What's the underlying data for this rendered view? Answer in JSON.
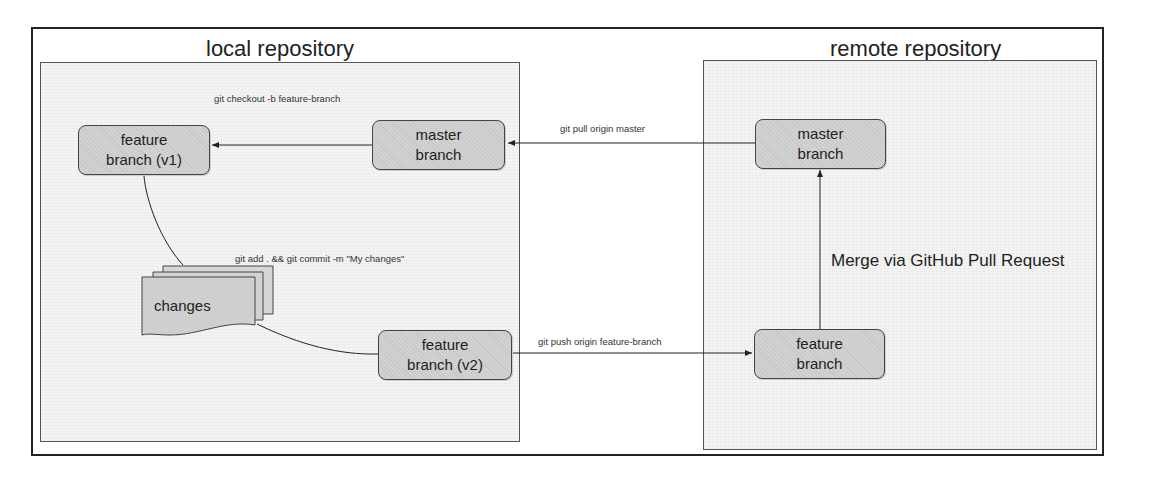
{
  "local": {
    "title": "local repository",
    "nodes": {
      "feature_v1": {
        "line1": "feature",
        "line2": "branch (v1)"
      },
      "master": {
        "line1": "master",
        "line2": "branch"
      },
      "feature_v2": {
        "line1": "feature",
        "line2": "branch (v2)"
      },
      "changes": {
        "label": "changes"
      }
    },
    "commands": {
      "checkout": "git checkout -b feature-branch",
      "commit": "git add . && git commit -m \"My changes\""
    }
  },
  "remote": {
    "title": "remote repository",
    "nodes": {
      "master": {
        "line1": "master",
        "line2": "branch"
      },
      "feature": {
        "line1": "feature",
        "line2": "branch"
      }
    },
    "merge_label": "Merge via GitHub Pull Request"
  },
  "transfers": {
    "pull": "git pull origin master",
    "push": "git push origin feature-branch"
  }
}
